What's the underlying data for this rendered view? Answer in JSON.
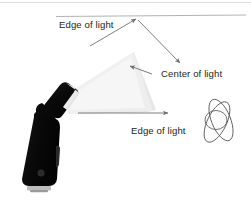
{
  "diagram": {
    "background_color": "#ffffff",
    "labels": {
      "edge_of_light_top": "Edge of light",
      "center_of_light": "Center of light",
      "edge_of_light_bottom": "Edge of light"
    },
    "colors": {
      "text": "#231f20",
      "arrow": "#6d6e71",
      "rule": "#a7a9ac",
      "flash_body": "#0b0b0b",
      "flash_highlight": "#f2f2f2",
      "cone_light": "#f1f1f1",
      "cone_shadow": "#e2e2e2",
      "subject_outline": "#58595b"
    },
    "elements": {
      "flash_unit": "speedlight-flash",
      "light_cone": "light-cone",
      "subject": "subject-figure",
      "top_rule": "horizontal-reference-line",
      "arrow_upper_edge": "upper-edge-arrow",
      "arrow_center": "center-arrow",
      "arrow_lower_edge": "lower-edge-arrow",
      "arrow_center_callout": "center-callout-arrow"
    }
  }
}
